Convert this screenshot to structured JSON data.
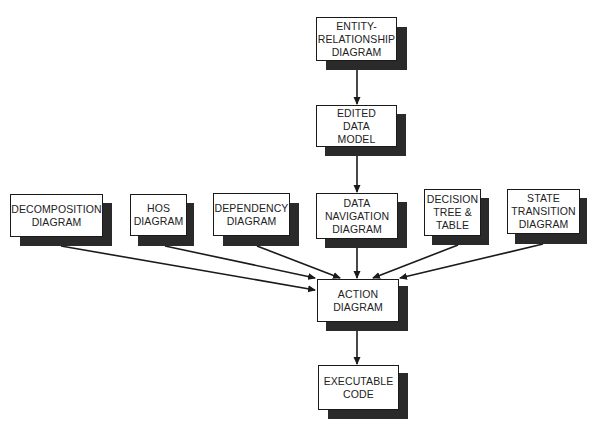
{
  "diagram": {
    "nodes": {
      "erd": {
        "lines": [
          "ENTITY-",
          "RELATIONSHIP",
          "DIAGRAM"
        ]
      },
      "edited": {
        "lines": [
          "EDITED",
          "DATA",
          "MODEL"
        ]
      },
      "decomp": {
        "lines": [
          "DECOMPOSITION",
          "DIAGRAM"
        ]
      },
      "hos": {
        "lines": [
          "HOS",
          "DIAGRAM"
        ]
      },
      "dependency": {
        "lines": [
          "DEPENDENCY",
          "DIAGRAM"
        ]
      },
      "datanav": {
        "lines": [
          "DATA",
          "NAVIGATION",
          "DIAGRAM"
        ]
      },
      "decision": {
        "lines": [
          "DECISION",
          "TREE &",
          "TABLE"
        ]
      },
      "state": {
        "lines": [
          "STATE",
          "TRANSITION",
          "DIAGRAM"
        ]
      },
      "action": {
        "lines": [
          "ACTION",
          "DIAGRAM"
        ]
      },
      "code": {
        "lines": [
          "EXECUTABLE",
          "CODE"
        ]
      }
    },
    "edges": [
      {
        "from": "ENTITY-RELATIONSHIP DIAGRAM",
        "to": "EDITED DATA MODEL"
      },
      {
        "from": "EDITED DATA MODEL",
        "to": "DATA NAVIGATION DIAGRAM"
      },
      {
        "from": "DECOMPOSITION DIAGRAM",
        "to": "ACTION DIAGRAM"
      },
      {
        "from": "HOS DIAGRAM",
        "to": "ACTION DIAGRAM"
      },
      {
        "from": "DEPENDENCY DIAGRAM",
        "to": "ACTION DIAGRAM"
      },
      {
        "from": "DATA NAVIGATION DIAGRAM",
        "to": "ACTION DIAGRAM"
      },
      {
        "from": "DECISION TREE & TABLE",
        "to": "ACTION DIAGRAM"
      },
      {
        "from": "STATE TRANSITION DIAGRAM",
        "to": "ACTION DIAGRAM"
      },
      {
        "from": "ACTION DIAGRAM",
        "to": "EXECUTABLE CODE"
      }
    ],
    "colors": {
      "line": "#1a1a1a",
      "shadow": "#2a2a2a",
      "box_fill": "#ffffff",
      "text": "#222222"
    }
  }
}
